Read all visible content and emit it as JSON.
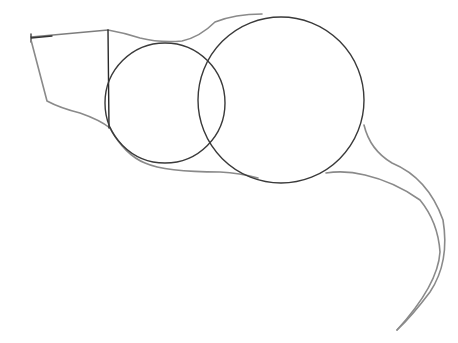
{
  "drawing": {
    "subject": "pencil sketch of a mouse body construction",
    "colors": {
      "background": "#ffffff",
      "outline": "#8a8a8a",
      "circles": "#3a3a3a",
      "guide": "#2a2a2a"
    }
  }
}
